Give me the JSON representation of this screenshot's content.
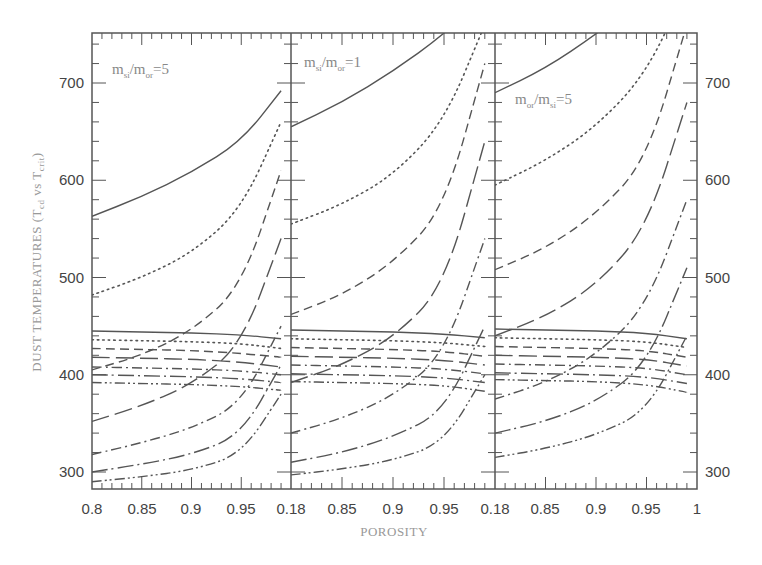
{
  "chart_data": {
    "type": "line",
    "title": "",
    "xlabel": "POROSITY",
    "ylabel": "DUST TEMPERATURES (T_cd vs T_crit)",
    "ylabel_parts": {
      "main": "DUST TEMPERATURES (T",
      "sub1": "cd",
      "mid": " vs T",
      "sub2": "crit",
      "end": ")"
    },
    "ylim": [
      280,
      750
    ],
    "yticks": [
      300,
      400,
      500,
      600,
      700
    ],
    "xlim": [
      0.8,
      1.0
    ],
    "xtick_labels_row": [
      "0.8",
      "0.85",
      "0.9",
      "0.95",
      "0.18",
      "0.85",
      "0.9",
      "0.95",
      "0.18",
      "0.85",
      "0.9",
      "0.95",
      "1"
    ],
    "grid": false,
    "legend": "none",
    "line_color": "#555555",
    "panels": [
      {
        "annotation": {
          "a": "m",
          "a_sub": "si",
          "b": "/m",
          "b_sub": "or",
          "c": "=5"
        },
        "x": [
          0.8,
          0.85,
          0.9,
          0.95,
          0.99
        ],
        "rising_series": [
          {
            "style": "solid",
            "values": [
              563,
              583,
              608,
              640,
              692
            ]
          },
          {
            "style": "dotted",
            "values": [
              482,
              500,
              525,
              570,
              660
            ]
          },
          {
            "style": "dashed",
            "values": [
              405,
              420,
              445,
              490,
              610
            ]
          },
          {
            "style": "longdash",
            "values": [
              352,
              368,
              390,
              430,
              540
            ]
          },
          {
            "style": "dashdot",
            "values": [
              318,
              330,
              345,
              370,
              450
            ]
          },
          {
            "style": "longdashdot",
            "values": [
              300,
              308,
              318,
              338,
              410
            ]
          },
          {
            "style": "dashdotdot",
            "values": [
              290,
              295,
              302,
              318,
              380
            ]
          }
        ],
        "flat_series": [
          {
            "style": "solid",
            "values": [
              445,
              444,
              443,
              441,
              437
            ]
          },
          {
            "style": "dotted",
            "values": [
              436,
              435,
              434,
              432,
              427
            ]
          },
          {
            "style": "dashed",
            "values": [
              427,
              426,
              425,
              422,
              418
            ]
          },
          {
            "style": "longdash",
            "values": [
              418,
              417,
              416,
              413,
              408
            ]
          },
          {
            "style": "dashdot",
            "values": [
              408,
              407,
              406,
              404,
              400
            ]
          },
          {
            "style": "longdashdot",
            "values": [
              400,
              399,
              398,
              396,
              392
            ]
          },
          {
            "style": "dashdotdot",
            "values": [
              392,
              391,
              390,
              388,
              384
            ]
          }
        ]
      },
      {
        "annotation": {
          "a": "m",
          "a_sub": "si",
          "b": "/m",
          "b_sub": "or",
          "c": "=1"
        },
        "x": [
          0.8,
          0.85,
          0.9,
          0.95,
          0.99
        ],
        "rising_series": [
          {
            "style": "solid",
            "values": [
              655,
              680,
              712,
              750,
              790
            ]
          },
          {
            "style": "dotted",
            "values": [
              555,
              575,
              605,
              660,
              760
            ]
          },
          {
            "style": "dashed",
            "values": [
              462,
              482,
              515,
              570,
              720
            ]
          },
          {
            "style": "longdash",
            "values": [
              392,
              410,
              438,
              490,
              640
            ]
          },
          {
            "style": "dashdot",
            "values": [
              340,
              355,
              378,
              420,
              540
            ]
          },
          {
            "style": "longdashdot",
            "values": [
              310,
              320,
              336,
              362,
              450
            ]
          },
          {
            "style": "dashdotdot",
            "values": [
              297,
              303,
              312,
              330,
              400
            ]
          }
        ],
        "flat_series": [
          {
            "style": "solid",
            "values": [
              446,
              445,
              444,
              442,
              438
            ]
          },
          {
            "style": "dotted",
            "values": [
              437,
              436,
              435,
              433,
              429
            ]
          },
          {
            "style": "dashed",
            "values": [
              428,
              427,
              426,
              424,
              419
            ]
          },
          {
            "style": "longdash",
            "values": [
              419,
              418,
              417,
              415,
              410
            ]
          },
          {
            "style": "dashdot",
            "values": [
              410,
              409,
              408,
              406,
              401
            ]
          },
          {
            "style": "longdashdot",
            "values": [
              401,
              400,
              399,
              397,
              392
            ]
          },
          {
            "style": "dashdotdot",
            "values": [
              393,
              392,
              391,
              389,
              383
            ]
          }
        ]
      },
      {
        "annotation": {
          "a": "m",
          "a_sub": "or",
          "b": "/m",
          "b_sub": "si",
          "c": "=5"
        },
        "x": [
          0.8,
          0.85,
          0.9,
          0.95,
          0.99
        ],
        "rising_series": [
          {
            "style": "solid",
            "values": [
              690,
              715,
              750,
              790,
              840
            ]
          },
          {
            "style": "dotted",
            "values": [
              595,
              620,
              655,
              710,
              800
            ]
          },
          {
            "style": "dashed",
            "values": [
              508,
              530,
              565,
              620,
              760
            ]
          },
          {
            "style": "longdash",
            "values": [
              440,
              460,
              492,
              550,
              680
            ]
          },
          {
            "style": "dashdot",
            "values": [
              375,
              392,
              420,
              470,
              580
            ]
          },
          {
            "style": "longdashdot",
            "values": [
              340,
              352,
              372,
              410,
              510
            ]
          },
          {
            "style": "dashdotdot",
            "values": [
              315,
              324,
              338,
              362,
              440
            ]
          }
        ],
        "flat_series": [
          {
            "style": "solid",
            "values": [
              447,
              446,
              445,
              443,
              437
            ]
          },
          {
            "style": "dotted",
            "values": [
              438,
              437,
              436,
              434,
              428
            ]
          },
          {
            "style": "dashed",
            "values": [
              429,
              428,
              427,
              425,
              418
            ]
          },
          {
            "style": "longdash",
            "values": [
              420,
              419,
              418,
              416,
              409
            ]
          },
          {
            "style": "dashdot",
            "values": [
              411,
              410,
              409,
              407,
              400
            ]
          },
          {
            "style": "longdashdot",
            "values": [
              402,
              401,
              400,
              398,
              391
            ]
          },
          {
            "style": "dashdotdot",
            "values": [
              395,
              394,
              393,
              390,
              382
            ]
          }
        ]
      }
    ]
  }
}
